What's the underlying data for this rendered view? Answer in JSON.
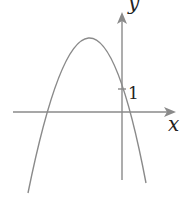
{
  "diagram": {
    "type": "function-graph",
    "colors": {
      "axis": "#8a8a8a",
      "curve": "#8a8a8a",
      "text": "#222222",
      "background": "#ffffff"
    },
    "axes": {
      "x_label": "x",
      "y_label": "y"
    },
    "ticks": [
      {
        "axis": "y",
        "label": "1"
      }
    ],
    "curve": {
      "shape": "parabola",
      "opens": "down",
      "vertex_quadrant": "second (left of y-axis, above x-axis)",
      "y_intercept": "1",
      "roots": [
        "negative",
        "small positive"
      ]
    }
  }
}
